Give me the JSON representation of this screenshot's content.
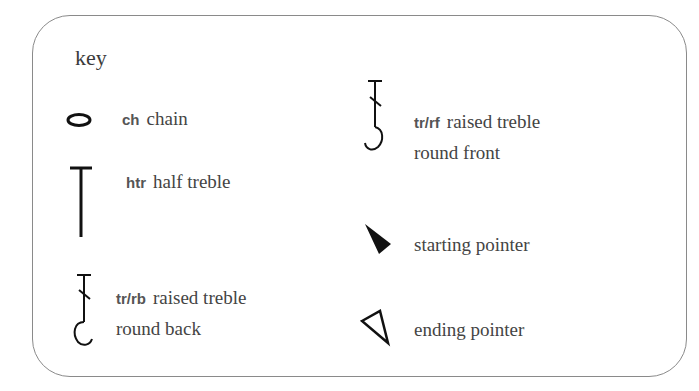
{
  "title": "key",
  "entries": [
    {
      "symbol": "chain-oval",
      "abbr": "ch",
      "label": "chain",
      "line2": ""
    },
    {
      "symbol": "half-treble-t",
      "abbr": "htr",
      "label": "half treble",
      "line2": ""
    },
    {
      "symbol": "raised-treble-back",
      "abbr": "tr/rb",
      "label": "raised treble",
      "line2": "round back"
    },
    {
      "symbol": "raised-treble-front",
      "abbr": "tr/rf",
      "label": "raised treble",
      "line2": "round front"
    },
    {
      "symbol": "filled-triangle",
      "abbr": "",
      "label": "starting pointer",
      "line2": ""
    },
    {
      "symbol": "outline-triangle",
      "abbr": "",
      "label": "ending pointer",
      "line2": ""
    }
  ],
  "colors": {
    "border": "#8a8a8a",
    "text": "#444444",
    "symbol": "#111111"
  }
}
